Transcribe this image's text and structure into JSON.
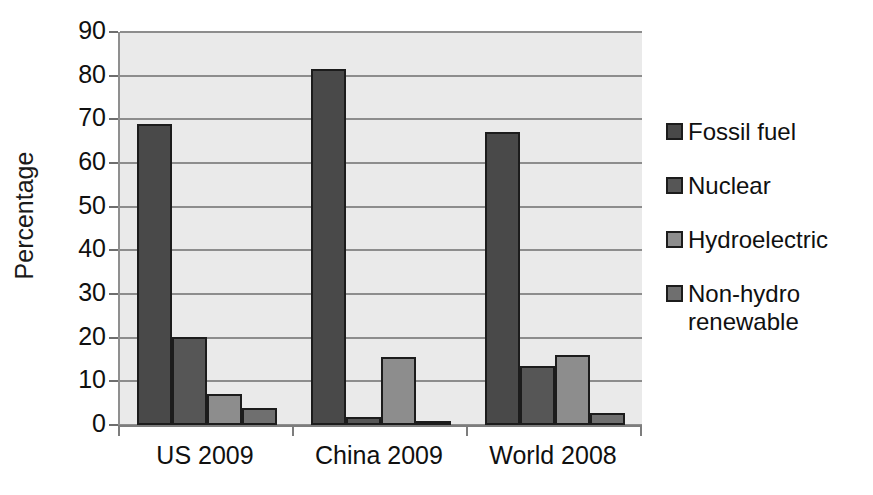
{
  "chart_data": {
    "type": "bar",
    "title": "",
    "xlabel": "",
    "ylabel": "Percentage",
    "ylim": [
      0,
      90
    ],
    "ytick_labels": [
      "90",
      "80",
      "70",
      "60",
      "50",
      "40",
      "30",
      "20",
      "10",
      "0"
    ],
    "ytick_values": [
      90,
      80,
      70,
      60,
      50,
      40,
      30,
      20,
      10,
      0
    ],
    "grid": true,
    "legend_position": "right",
    "categories": [
      "US 2009",
      "China 2009",
      "World 2008"
    ],
    "series": [
      {
        "name": "Fossil fuel",
        "color": "#494949",
        "values": [
          69.0,
          81.5,
          67.0
        ]
      },
      {
        "name": "Nuclear",
        "color": "#565656",
        "values": [
          20.2,
          1.9,
          13.5
        ]
      },
      {
        "name": "Hydroelectric",
        "color": "#8d8d8d",
        "values": [
          7.0,
          15.6,
          16.0
        ]
      },
      {
        "name": "Non-hydro renewable",
        "color": "#6f6f6f",
        "values": [
          3.8,
          0.7,
          2.7
        ]
      }
    ]
  },
  "legend": {
    "items": [
      {
        "label": "Fossil fuel"
      },
      {
        "label": "Nuclear"
      },
      {
        "label": "Hydroelectric"
      },
      {
        "label": "Non-hydro renewable"
      }
    ]
  },
  "colors": {
    "plot_background": "#eaeaea",
    "gridline": "#8d8d8d",
    "bar_outline": "#1c1c1c",
    "axis": "#7d7d7d",
    "text": "#101010"
  }
}
